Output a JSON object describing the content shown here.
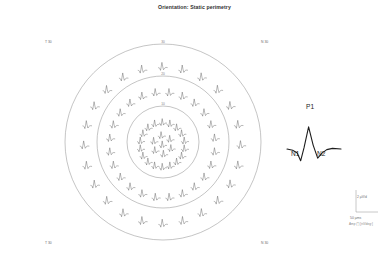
{
  "figure": {
    "title": "Orientation: Static perimetry"
  },
  "corner_labels": {
    "top_left": "T 30",
    "top_right": "N 30",
    "bottom_left": "T 30",
    "bottom_right": "N 30"
  },
  "ring_labels": {
    "outer": "30",
    "middle": "20",
    "inner": "10"
  },
  "waveform_legend": {
    "p1": "P1",
    "n1": "N1",
    "n2": "N2"
  },
  "scale_legend": {
    "amplitude": "2 µV/d",
    "time": "50 µms",
    "unit": "Amp (*) [nV/deg²]"
  },
  "colors": {
    "trace": "#555555",
    "circle": "#8a8a8a",
    "text": "#4a4a4a",
    "title": "#303030",
    "legend_trace": "#1d1d1d"
  },
  "chart_data": {
    "type": "line",
    "title": "Orientation: Static perimetry",
    "subtype": "multifocal-ERG trace array on concentric perimetry rings",
    "xlabel": "Time [ms]",
    "ylabel": "Amplitude [nV/deg²]",
    "grid": false,
    "legend_position": "right",
    "axis_extent_deg": 30,
    "center": {
      "cx": 163,
      "cy": 142
    },
    "rings": [
      {
        "name": "inner",
        "eccentricity_deg": 10,
        "radius_px": 36,
        "trace_count": 18
      },
      {
        "name": "middle",
        "eccentricity_deg": 20,
        "radius_px": 66,
        "trace_count": 24
      },
      {
        "name": "outer",
        "eccentricity_deg": 30,
        "radius_px": 98,
        "trace_count": 24
      }
    ],
    "trace_waveform": {
      "description": "biphasic mfERG response: N1 trough, P1 peak, N2 trough",
      "x": [
        0,
        10,
        18,
        24,
        30,
        38,
        46,
        54,
        62,
        70,
        80,
        95
      ],
      "y": [
        0,
        -2,
        -6,
        -18,
        2,
        34,
        6,
        -14,
        -6,
        -1,
        1,
        0
      ],
      "components": [
        {
          "name": "N1",
          "time_ms": 24,
          "amplitude_nv_deg2": -18
        },
        {
          "name": "P1",
          "time_ms": 38,
          "amplitude_nv_deg2": 34
        },
        {
          "name": "N2",
          "time_ms": 54,
          "amplitude_nv_deg2": -14
        }
      ]
    },
    "scale_bars": {
      "amplitude": {
        "label": "2 µV/d",
        "value": 2,
        "unit": "µV/deg"
      },
      "time": {
        "label": "50 µms",
        "value": 50,
        "unit": "ms"
      }
    }
  }
}
